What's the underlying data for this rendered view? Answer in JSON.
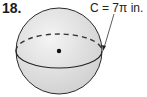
{
  "problem": {
    "number": "18.",
    "label": "C = 7π in."
  },
  "figure": {
    "shape": "sphere",
    "circumference_label": "C = 7π in.",
    "features": [
      "equator-solid-front",
      "equator-dashed-back",
      "center-point",
      "leader-arrow"
    ]
  }
}
